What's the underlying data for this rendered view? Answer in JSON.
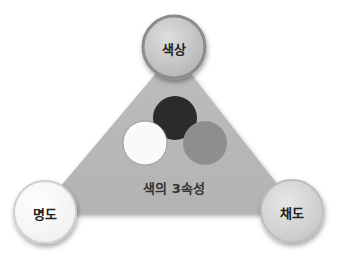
{
  "diagram": {
    "title": "색의 3속성",
    "nodes": [
      {
        "id": "hue",
        "label": "색상",
        "position": "top",
        "fill": "#c8c8c8"
      },
      {
        "id": "value",
        "label": "명도",
        "position": "bottom-left",
        "fill": "#ffffff"
      },
      {
        "id": "saturation",
        "label": "채도",
        "position": "bottom-right",
        "fill": "#d6d6d6"
      }
    ],
    "inner_circles": [
      {
        "name": "dark-circle",
        "fill": "#2b2b2b"
      },
      {
        "name": "white-circle",
        "fill": "#fafafa"
      },
      {
        "name": "gray-circle",
        "fill": "#8e8e8e"
      }
    ],
    "triangle_fill": "#b9b9b9"
  }
}
